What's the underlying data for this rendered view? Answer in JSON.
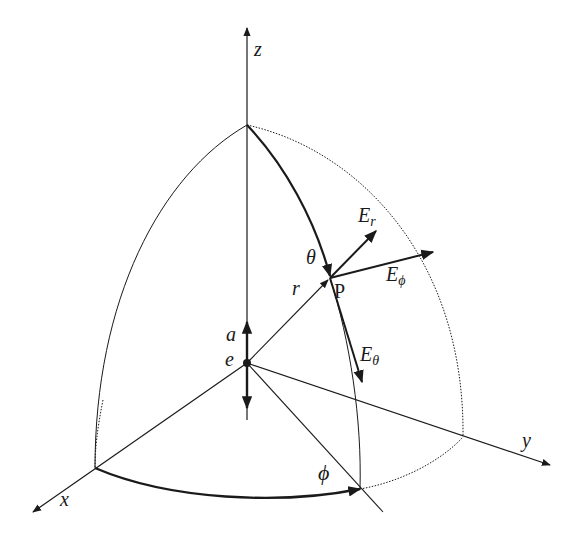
{
  "diagram": {
    "type": "spherical-coordinates-field-diagram",
    "axes": {
      "z": {
        "label": "z"
      },
      "x": {
        "label": "x"
      },
      "y": {
        "label": "y"
      }
    },
    "origin": {
      "label": "e"
    },
    "dipole_arrow": {
      "label": "a"
    },
    "point": {
      "label": "P"
    },
    "radius": {
      "label": "r"
    },
    "angles": {
      "theta": {
        "label": "θ"
      },
      "phi": {
        "label": "ϕ"
      }
    },
    "field_vectors": [
      {
        "name": "E_r",
        "base": "E",
        "sub": "r"
      },
      {
        "name": "E_phi",
        "base": "E",
        "sub": "ϕ"
      },
      {
        "name": "E_theta",
        "base": "E",
        "sub": "θ"
      }
    ],
    "colors": {
      "ink": "#1a1a1a",
      "background": "#ffffff"
    }
  }
}
